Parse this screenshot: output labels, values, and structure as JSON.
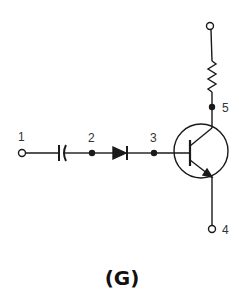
{
  "diagram": {
    "type": "circuit-schematic",
    "caption": "(G)",
    "nodes": [
      {
        "id": "1",
        "label": "1",
        "kind": "terminal-open"
      },
      {
        "id": "2",
        "label": "2",
        "kind": "junction"
      },
      {
        "id": "3",
        "label": "3",
        "kind": "junction"
      },
      {
        "id": "4",
        "label": "4",
        "kind": "terminal-open"
      },
      {
        "id": "5",
        "label": "5",
        "kind": "junction"
      },
      {
        "id": "top",
        "label": "",
        "kind": "terminal-open"
      }
    ],
    "components": [
      {
        "name": "capacitor",
        "between": [
          "1",
          "2"
        ]
      },
      {
        "name": "diode",
        "between": [
          "2",
          "3"
        ],
        "orientation": "anode-left"
      },
      {
        "name": "npn-transistor",
        "base": "3",
        "collector": "5",
        "emitter": "4"
      },
      {
        "name": "resistor",
        "between": [
          "top",
          "5"
        ]
      }
    ],
    "colors": {
      "line": "#1a1a1a",
      "background": "#ffffff"
    }
  }
}
